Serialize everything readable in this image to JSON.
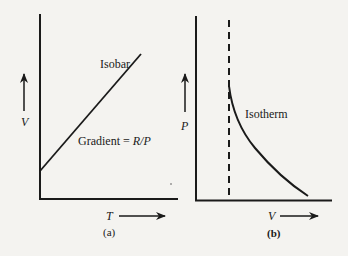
{
  "panels": [
    {
      "id": "a",
      "caption": "(a)",
      "x_axis_label": "T",
      "y_axis_label": "V",
      "curve_label": "Isobar",
      "annotation": {
        "prefix": "Gradient = ",
        "value": "R/P"
      }
    },
    {
      "id": "b",
      "caption": "(b)",
      "x_axis_label": "V",
      "y_axis_label": "P",
      "curve_label": "Isotherm"
    }
  ],
  "colors": {
    "ink": "#1a1a1a",
    "paper": "#f4f3f0"
  }
}
